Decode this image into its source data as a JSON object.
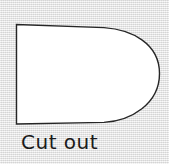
{
  "figure": {
    "name": "cut-out-pattern-piece",
    "background_color": "#e4e4e4",
    "background_texture": "halftone-dither"
  },
  "shape": {
    "name": "bullet-shape-outline",
    "description": "Closed outline with straight vertical left edge, slightly curved top and bottom edges, and a large rounded right end",
    "fill_color": "#ffffff",
    "stroke_color": "#262626",
    "stroke_width": 1.4,
    "path": "M 16.5,24.5 L 16.5,124.0 L 104.0,122.4 C 131.0,120.6 159.5,104.0 159.5,73.5 C 159.5,43.0 131.0,29.5 104.0,27.6 Z",
    "vertices": {
      "top_left": [
        16.5,
        24.5
      ],
      "bottom_left": [
        16.5,
        124.0
      ],
      "rightmost": [
        159.5,
        73.5
      ]
    }
  },
  "caption": {
    "name": "cut-out-label",
    "text": "Cut out",
    "color": "#1a1a1a",
    "font_size_px": 20,
    "position": [
      21,
      130
    ]
  }
}
